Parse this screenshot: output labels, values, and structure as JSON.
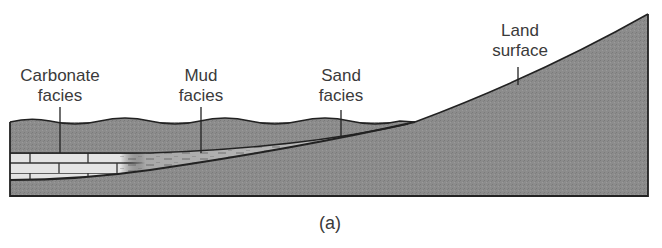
{
  "figure": {
    "caption": "(a)",
    "labels": {
      "carbonate": {
        "line1": "Carbonate",
        "line2": "facies"
      },
      "mud": {
        "line1": "Mud",
        "line2": "facies"
      },
      "sand": {
        "line1": "Sand",
        "line2": "facies"
      },
      "land": {
        "line1": "Land",
        "line2": "surface"
      }
    },
    "colors": {
      "rock": "#8a8a8a",
      "water": "#9a9a9a",
      "carbonate": "#e2e2e2",
      "mud": "#b9b9b9",
      "sand": "#d0d0d0",
      "outline": "#222222",
      "text": "#3a3a3a"
    }
  }
}
